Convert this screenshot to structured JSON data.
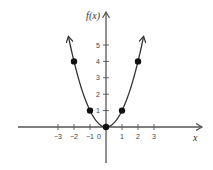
{
  "chart_data": {
    "type": "line",
    "title": "",
    "function": "f(x) = x^2",
    "xlabel": "x",
    "ylabel": "f(x)",
    "xlim": [
      -5.5,
      6.0
    ],
    "ylim": [
      -2.2,
      7.0
    ],
    "x_ticks": [
      -3,
      -2,
      -1,
      1,
      2,
      3
    ],
    "x_tick_labels": [
      "−3",
      "−2",
      "−1",
      "1",
      "2",
      "3"
    ],
    "origin_label": "0",
    "y_ticks": [
      1,
      2,
      3,
      4,
      5
    ],
    "y_tick_labels": [
      "1",
      "2",
      "3",
      "4",
      "5"
    ],
    "curve_domain": [
      -2.35,
      2.35
    ],
    "points": [
      {
        "x": -2,
        "y": 4
      },
      {
        "x": -1,
        "y": 1
      },
      {
        "x": 0,
        "y": 0
      },
      {
        "x": 1,
        "y": 1
      },
      {
        "x": 2,
        "y": 4
      }
    ],
    "grid": false,
    "legend": "none"
  }
}
